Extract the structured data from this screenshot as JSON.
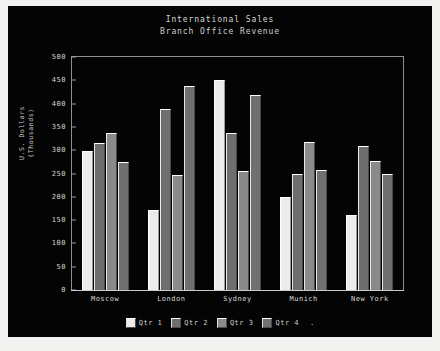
{
  "chart_data": {
    "type": "bar",
    "title": "International Sales",
    "subtitle": "Branch Office Revenue",
    "xlabel": "",
    "ylabel": "U.S. Dollars",
    "ylabel_line2": "(Thousands)",
    "ylim": [
      0,
      500
    ],
    "yticks": [
      500,
      450,
      400,
      350,
      300,
      250,
      200,
      150,
      100,
      50,
      0
    ],
    "grid": false,
    "legend_position": "bottom",
    "legend_trailing_text": ".",
    "categories": [
      "Moscow",
      "London",
      "Sydney",
      "Munich",
      "New York"
    ],
    "series": [
      {
        "name": "Qtr 1",
        "color": "#ececec",
        "values": [
          298,
          172,
          450,
          200,
          162
        ]
      },
      {
        "name": "Qtr 2",
        "color": "#6e6e6e",
        "values": [
          315,
          388,
          338,
          248,
          310
        ]
      },
      {
        "name": "Qtr 3",
        "color": "#8a8a8a",
        "values": [
          337,
          247,
          255,
          318,
          277
        ]
      },
      {
        "name": "Qtr 4",
        "color": "#707070",
        "values": [
          275,
          437,
          418,
          258,
          250
        ]
      }
    ]
  },
  "theme": {
    "page_background": "#f2f2f0",
    "chart_background": "#040404",
    "axis_color": "#c9c9c9",
    "text_color": "#d8d8d8",
    "frame_color": "#8f8f8f"
  }
}
